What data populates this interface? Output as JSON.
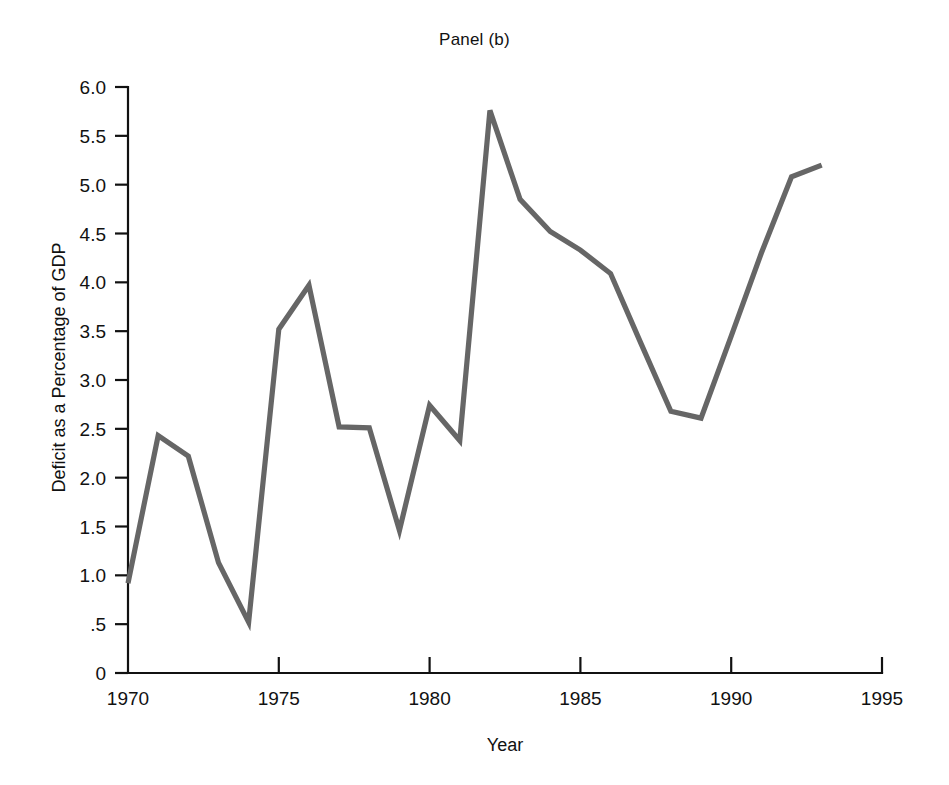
{
  "figure": {
    "title": "Panel (b)",
    "background_color": "#ffffff",
    "text_color": "#111111"
  },
  "chart_data": {
    "type": "line",
    "title": "Panel (b)",
    "xlabel": "Year",
    "ylabel": "Deficit as a Percentage of GDP",
    "xlim": [
      1970,
      1995
    ],
    "ylim": [
      0,
      6.0
    ],
    "grid": false,
    "legend": null,
    "line_color": "#666666",
    "x_tick_labels": [
      "1970",
      "1975",
      "1980",
      "1985",
      "1990",
      "1995"
    ],
    "x_ticks": [
      1970,
      1975,
      1980,
      1985,
      1990,
      1995
    ],
    "y_tick_labels": [
      "0",
      ".5",
      "1.0",
      "1.5",
      "2.0",
      "2.5",
      "3.0",
      "3.5",
      "4.0",
      "4.5",
      "5.0",
      "5.5",
      "6.0"
    ],
    "y_ticks": [
      0,
      0.5,
      1.0,
      1.5,
      2.0,
      2.5,
      3.0,
      3.5,
      4.0,
      4.5,
      5.0,
      5.5,
      6.0
    ],
    "x": [
      1970,
      1971,
      1972,
      1973,
      1974,
      1975,
      1976,
      1977,
      1978,
      1979,
      1980,
      1981,
      1982,
      1983,
      1984,
      1985,
      1986,
      1987,
      1988,
      1989,
      1990,
      1991,
      1992,
      1993
    ],
    "values": [
      0.92,
      2.43,
      2.22,
      1.13,
      0.52,
      3.52,
      3.97,
      2.52,
      2.51,
      1.46,
      2.74,
      2.38,
      5.76,
      4.85,
      4.52,
      4.33,
      4.09,
      3.38,
      2.68,
      2.61,
      3.45,
      4.3,
      5.08,
      5.2
    ],
    "series": [
      {
        "name": "Deficit as a Percentage of GDP",
        "values": [
          0.92,
          2.43,
          2.22,
          1.13,
          0.52,
          3.52,
          3.97,
          2.52,
          2.51,
          1.46,
          2.74,
          2.38,
          5.76,
          4.85,
          4.52,
          4.33,
          4.09,
          3.38,
          2.68,
          2.61,
          3.45,
          4.3,
          5.08,
          5.2
        ]
      }
    ]
  }
}
